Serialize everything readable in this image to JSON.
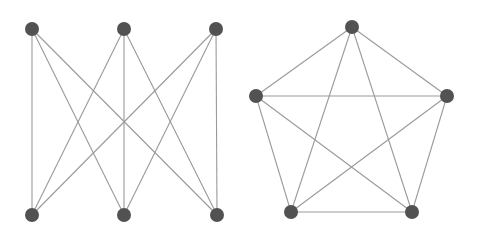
{
  "diagrams": [
    {
      "name": "K3,3 complete bipartite graph",
      "nodes": [
        {
          "id": "a1",
          "x": 32,
          "y": 29
        },
        {
          "id": "a2",
          "x": 124,
          "y": 29
        },
        {
          "id": "a3",
          "x": 216,
          "y": 29
        },
        {
          "id": "b1",
          "x": 32,
          "y": 215
        },
        {
          "id": "b2",
          "x": 124,
          "y": 215
        },
        {
          "id": "b3",
          "x": 217,
          "y": 215
        }
      ],
      "edges": [
        [
          "a1",
          "b1"
        ],
        [
          "a1",
          "b2"
        ],
        [
          "a1",
          "b3"
        ],
        [
          "a2",
          "b1"
        ],
        [
          "a2",
          "b2"
        ],
        [
          "a2",
          "b3"
        ],
        [
          "a3",
          "b1"
        ],
        [
          "a3",
          "b2"
        ],
        [
          "a3",
          "b3"
        ]
      ]
    },
    {
      "name": "K5 complete graph",
      "nodes": [
        {
          "id": "p1",
          "x": 352,
          "y": 27
        },
        {
          "id": "p2",
          "x": 447,
          "y": 96
        },
        {
          "id": "p3",
          "x": 412,
          "y": 212
        },
        {
          "id": "p4",
          "x": 291,
          "y": 212
        },
        {
          "id": "p5",
          "x": 256,
          "y": 96
        }
      ],
      "edges": [
        [
          "p1",
          "p2"
        ],
        [
          "p1",
          "p3"
        ],
        [
          "p1",
          "p4"
        ],
        [
          "p1",
          "p5"
        ],
        [
          "p2",
          "p3"
        ],
        [
          "p2",
          "p4"
        ],
        [
          "p2",
          "p5"
        ],
        [
          "p3",
          "p4"
        ],
        [
          "p3",
          "p5"
        ],
        [
          "p4",
          "p5"
        ]
      ]
    }
  ],
  "style": {
    "node_color": "#525252",
    "edge_color": "#9a9a9a",
    "node_radius": 7
  }
}
